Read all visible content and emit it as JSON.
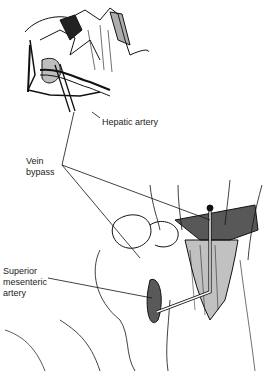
{
  "figure": {
    "type": "anatomical surgical illustration",
    "colors": {
      "ink": "#111111",
      "background": "#ffffff"
    }
  },
  "labels": {
    "hepatic_artery": "Hepatic artery",
    "vein_bypass": [
      "Vein",
      "bypass"
    ],
    "superior_mesenteric_artery": [
      "Superior",
      "mesenteric",
      "artery"
    ]
  }
}
